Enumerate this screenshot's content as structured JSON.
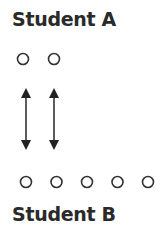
{
  "diagram": {
    "student_a": {
      "label": "Student A",
      "circle_count": 2
    },
    "student_b": {
      "label": "Student B",
      "circle_count": 5
    },
    "arrows": {
      "count": 2,
      "type": "double-headed",
      "connects": "Student A circles to Student B circles"
    },
    "colors": {
      "stroke": "#333333",
      "text": "#2a2a2a"
    }
  }
}
